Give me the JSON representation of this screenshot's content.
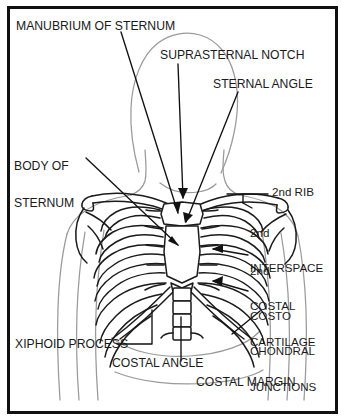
{
  "figure": {
    "border_color": "#111111",
    "ink_color": "#1a1a1a",
    "body_outline_color": "#9a9a9a",
    "background_color": "#ffffff"
  },
  "labels": {
    "manubrium": "MANUBRIUM OF STERNUM",
    "suprasternal_notch": "SUPRASTERNAL NOTCH",
    "sternal_angle": "STERNAL ANGLE",
    "body_of_sternum_line1": "BODY OF",
    "body_of_sternum_line2": "STERNUM",
    "second_rib": "2nd RIB",
    "second_interspace_line1": "2nd",
    "second_interspace_line2": "INTERSPACE",
    "second_costal_cartilage_line1": "2nd",
    "second_costal_cartilage_line2": "COSTAL",
    "second_costal_cartilage_line3": "CARTILAGE",
    "costochondral_junctions_line1": "COSTO",
    "costochondral_junctions_line2": "CHONDRAL",
    "costochondral_junctions_line3": "JUNCTIONS",
    "xiphoid_process": "XIPHOID PROCESS",
    "costal_angle": "COSTAL ANGLE",
    "costal_margin": "COSTAL MARGIN"
  },
  "anatomy": {
    "structures": [
      "head",
      "neck",
      "shoulders",
      "arms",
      "torso",
      "clavicle",
      "scapula",
      "sternum-manubrium",
      "sternum-body",
      "xiphoid-process",
      "ribs",
      "costal-cartilages",
      "vertebral-column"
    ],
    "rib_pair_count": 10,
    "view": "anterior"
  }
}
